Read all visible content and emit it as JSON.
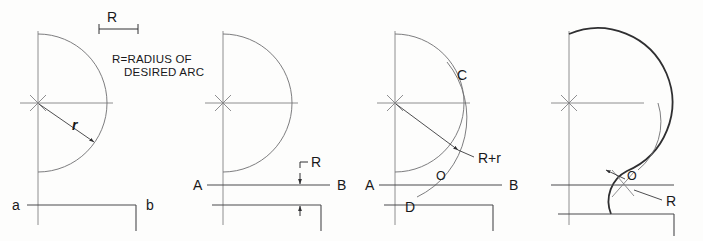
{
  "figure": {
    "background_color": "#fdfdfc",
    "line_color": "#4a4a4c",
    "panel_count": 4
  },
  "panel_a": {
    "id": "panel-a",
    "dimension_label": "R",
    "note_line1": "R=RADIUS OF",
    "note_line2": "DESIRED ARC",
    "radius_label": "r",
    "corner_label_left": "a",
    "corner_label_right": "b"
  },
  "panel_b": {
    "id": "panel-b",
    "point_a": "A",
    "point_b": "B",
    "offset_label": "R"
  },
  "panel_c": {
    "id": "panel-c",
    "point_a": "A",
    "point_b": "B",
    "point_c": "C",
    "point_d": "D",
    "center_label": "O",
    "radius_sum_label": "R+r"
  },
  "panel_d": {
    "id": "panel-d",
    "center_label": "O",
    "radius_label": "R"
  }
}
